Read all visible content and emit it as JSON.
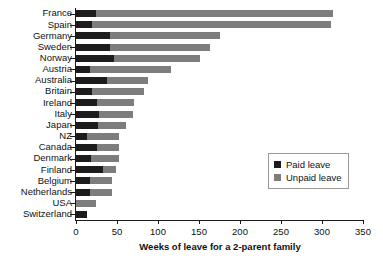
{
  "chart_data": {
    "type": "bar",
    "orientation": "horizontal",
    "stacked": true,
    "title": "",
    "xlabel": "Weeks of leave for a 2-parent family",
    "ylabel": "",
    "xlim": [
      0,
      350
    ],
    "xticks": [
      0,
      50,
      100,
      150,
      200,
      250,
      300,
      350
    ],
    "grid": false,
    "legend_position": "middle-right",
    "categories": [
      "France",
      "Spain",
      "Germany",
      "Sweden",
      "Norway",
      "Austria",
      "Australia",
      "Britain",
      "Ireland",
      "Italy",
      "Japan",
      "NZ",
      "Canada",
      "Denmark",
      "Finland",
      "Belgium",
      "Netherlands",
      "USA",
      "Switzerland"
    ],
    "series": [
      {
        "name": "Paid leave",
        "color": "#1c1c1c",
        "values": [
          24,
          20,
          42,
          42,
          46,
          17,
          38,
          20,
          26,
          28,
          27,
          14,
          25,
          18,
          33,
          17,
          17,
          0,
          14
        ]
      },
      {
        "name": "Unpaid leave",
        "color": "#7d7d7d",
        "values": [
          289,
          291,
          134,
          121,
          105,
          99,
          50,
          63,
          45,
          41,
          34,
          38,
          27,
          34,
          16,
          27,
          27,
          24,
          0
        ]
      }
    ],
    "totals": [
      313,
      311,
      176,
      163,
      151,
      116,
      88,
      83,
      71,
      69,
      61,
      52,
      52,
      52,
      49,
      44,
      44,
      24,
      14
    ]
  },
  "legend": {
    "items": [
      {
        "label": "Paid leave",
        "swatch": "paid-swatch"
      },
      {
        "label": "Unpaid leave",
        "swatch": "unpaid-swatch"
      }
    ]
  }
}
